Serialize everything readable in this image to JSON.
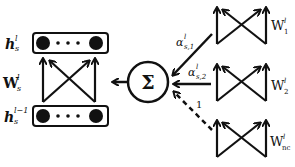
{
  "diagram": {
    "left_module": {
      "top_layer_label": "h",
      "top_layer_sup": "l",
      "top_layer_sub": "s",
      "weight_label": "W",
      "weight_sup": "l",
      "weight_sub": "s",
      "bottom_layer_label": "h",
      "bottom_layer_sup": "l−1",
      "bottom_layer_sub": "s"
    },
    "sum_node": {
      "symbol": "Σ"
    },
    "edges": [
      {
        "label": "α",
        "sup": "l",
        "sub": "s,1",
        "style": "solid"
      },
      {
        "label": "α",
        "sup": "l",
        "sub": "s,2",
        "style": "solid"
      },
      {
        "label": "1",
        "sup": "",
        "sub": "",
        "style": "dashed"
      }
    ],
    "right_modules": [
      {
        "label": "W",
        "sup": "l",
        "sub": "1"
      },
      {
        "label": "W",
        "sup": "l",
        "sub": "2"
      },
      {
        "label": "W",
        "sup": "l",
        "sub": "nc"
      }
    ],
    "colors": {
      "stroke": "#111111",
      "background": "#ffffff"
    }
  }
}
